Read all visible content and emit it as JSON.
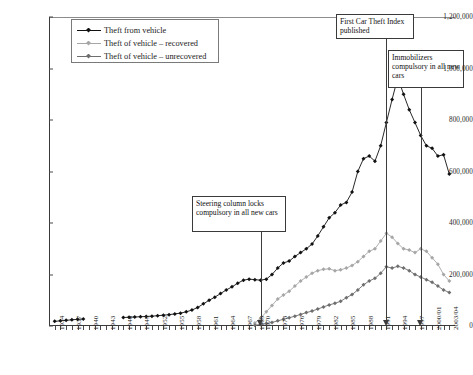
{
  "chart_data": {
    "type": "line",
    "title": "",
    "xlabel": "",
    "ylabel": "",
    "ylim": [
      0,
      1200000
    ],
    "grid": false,
    "legend_position": "top-left",
    "ytick_labels": [
      "1,200,000",
      "1,000,000",
      "800,000",
      "600,000",
      "400,000",
      "200,000",
      "0"
    ],
    "ytick_values": [
      1200000,
      1000000,
      800000,
      600000,
      400000,
      200000,
      0
    ],
    "xtick_labels": [
      "1934",
      "1937",
      "1940",
      "1943",
      "1946",
      "1949",
      "1952",
      "1955",
      "1958",
      "1961",
      "1964",
      "1967",
      "1969",
      "1970",
      "1973",
      "1976",
      "1979",
      "1982",
      "1985",
      "1988",
      "1991",
      "1994",
      "1997",
      "2000/01",
      "2003/04"
    ],
    "x": [
      1934,
      1935,
      1936,
      1937,
      1938,
      1939,
      1940,
      1941,
      1942,
      1943,
      1944,
      1945,
      1946,
      1947,
      1948,
      1949,
      1950,
      1951,
      1952,
      1953,
      1954,
      1955,
      1956,
      1957,
      1958,
      1959,
      1960,
      1961,
      1962,
      1963,
      1964,
      1965,
      1966,
      1967,
      1968,
      1969,
      1970,
      1971,
      1972,
      1973,
      1974,
      1975,
      1976,
      1977,
      1978,
      1979,
      1980,
      1981,
      1982,
      1983,
      1984,
      1985,
      1986,
      1987,
      1988,
      1989,
      1990,
      1991,
      1992,
      1993,
      1994,
      1995,
      1996,
      1997,
      1998,
      1999,
      2000,
      2001,
      2002,
      2003
    ],
    "series": [
      {
        "name": "Theft from vehicle",
        "color": "#111111",
        "marker": "diamond",
        "values": [
          18000,
          20000,
          22000,
          24000,
          26000,
          27000,
          null,
          null,
          null,
          null,
          null,
          null,
          33000,
          34000,
          35000,
          36000,
          37000,
          38000,
          40000,
          42000,
          44000,
          47000,
          50000,
          55000,
          62000,
          72000,
          86000,
          100000,
          112000,
          126000,
          140000,
          152000,
          166000,
          178000,
          182000,
          180000,
          178000,
          182000,
          200000,
          225000,
          245000,
          252000,
          270000,
          285000,
          300000,
          318000,
          350000,
          385000,
          420000,
          440000,
          470000,
          480000,
          520000,
          600000,
          650000,
          660000,
          640000,
          700000,
          790000,
          880000,
          965000,
          900000,
          840000,
          790000,
          740000,
          700000,
          690000,
          660000,
          665000,
          590000
        ]
      },
      {
        "name": "Theft of vehicle – recovered",
        "color": "#a6a6a6",
        "marker": "diamond",
        "values": [
          null,
          null,
          null,
          null,
          null,
          null,
          null,
          null,
          null,
          null,
          null,
          null,
          null,
          null,
          null,
          null,
          null,
          null,
          null,
          null,
          null,
          null,
          null,
          null,
          null,
          null,
          null,
          null,
          null,
          null,
          null,
          null,
          null,
          null,
          null,
          12000,
          30000,
          55000,
          80000,
          105000,
          120000,
          135000,
          155000,
          175000,
          190000,
          205000,
          215000,
          220000,
          222000,
          215000,
          218000,
          225000,
          235000,
          250000,
          270000,
          290000,
          300000,
          330000,
          360000,
          345000,
          320000,
          300000,
          295000,
          285000,
          300000,
          290000,
          265000,
          240000,
          200000,
          175000
        ]
      },
      {
        "name": "Theft of vehicle – unrecovered",
        "color": "#6e6e6e",
        "marker": "diamond",
        "values": [
          null,
          null,
          null,
          null,
          null,
          null,
          null,
          null,
          null,
          null,
          null,
          null,
          null,
          null,
          null,
          null,
          null,
          null,
          null,
          null,
          null,
          null,
          null,
          null,
          null,
          null,
          null,
          null,
          null,
          null,
          null,
          null,
          null,
          null,
          null,
          3000,
          6000,
          10000,
          14000,
          20000,
          26000,
          32000,
          38000,
          45000,
          52000,
          58000,
          66000,
          74000,
          82000,
          88000,
          96000,
          110000,
          122000,
          140000,
          160000,
          175000,
          185000,
          205000,
          230000,
          225000,
          232000,
          225000,
          215000,
          200000,
          190000,
          180000,
          170000,
          155000,
          140000,
          130000
        ]
      }
    ],
    "annotations": [
      {
        "id": "steering-column",
        "text": "Steering column locks compulsory in all new cars",
        "target_year": 1970,
        "box_left": 192,
        "box_top": 196,
        "box_width": 94,
        "box_height": 36
      },
      {
        "id": "first-car-theft-index",
        "text": "First Car Theft Index published",
        "target_year": 1992,
        "box_left": 336,
        "box_top": 14,
        "box_width": 78,
        "box_height": 25
      },
      {
        "id": "immobilizers",
        "text": "Immobilizers compulsory in all new cars",
        "target_year": 1998,
        "box_left": 388,
        "box_top": 50,
        "box_width": 76,
        "box_height": 38
      }
    ]
  },
  "legend": {
    "items": [
      {
        "label": "Theft from vehicle",
        "color": "#111111"
      },
      {
        "label": "Theft of vehicle – recovered",
        "color": "#a6a6a6"
      },
      {
        "label": "Theft of vehicle – unrecovered",
        "color": "#6e6e6e"
      }
    ]
  },
  "annotation_text": {
    "steering_column": "Steering column locks compulsory in all new cars",
    "first_car_theft_index": "First Car Theft Index published",
    "immobilizers": "Immobilizers compulsory in all new cars"
  },
  "caption": ""
}
